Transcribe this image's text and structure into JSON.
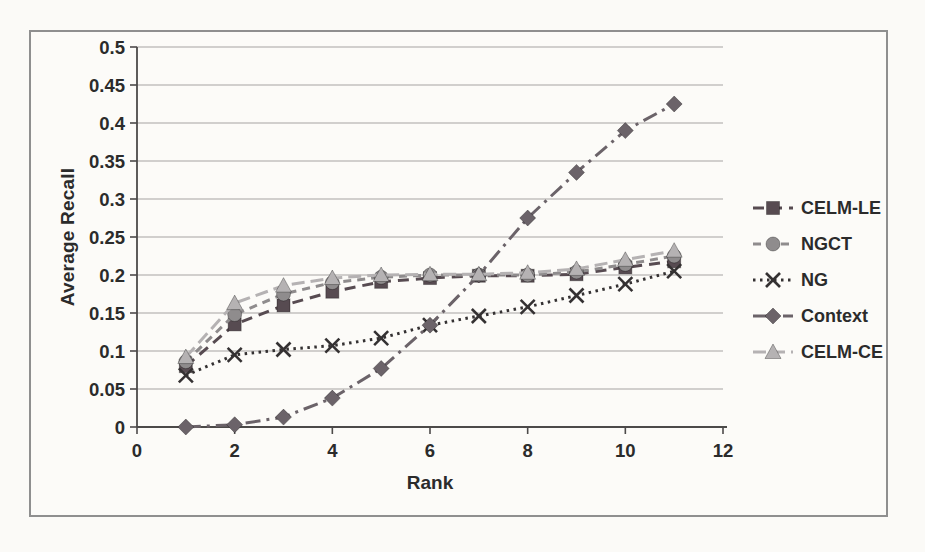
{
  "figure": {
    "background": "#fbfaf7",
    "frame_border_color": "#8f8f8f",
    "text_color": "#2b2b2b",
    "grid_color": "#a6a4a1",
    "axis_color": "#4c4a49"
  },
  "chart_data": {
    "type": "line",
    "title": "",
    "xlabel": "Rank",
    "ylabel": "Average Recall",
    "xlim": [
      0,
      12
    ],
    "ylim": [
      0,
      0.5
    ],
    "grid": "horizontal",
    "legend_position": "right-outside",
    "x_tick_values": [
      0,
      2,
      4,
      6,
      8,
      10,
      12
    ],
    "x_tick_labels": [
      "0",
      "2",
      "4",
      "6",
      "8",
      "10",
      "12"
    ],
    "y_tick_values": [
      0,
      0.05,
      0.1,
      0.15,
      0.2,
      0.25,
      0.3,
      0.35,
      0.4,
      0.45,
      0.5
    ],
    "y_tick_labels": [
      "0",
      "0.05",
      "0.1",
      "0.15",
      "0.2",
      "0.25",
      "0.3",
      "0.35",
      "0.4",
      "0.45",
      "0.5"
    ],
    "x": [
      1,
      2,
      3,
      4,
      5,
      6,
      7,
      8,
      9,
      10,
      11
    ],
    "series": [
      {
        "name": "CELM-LE",
        "marker": "square",
        "color": "#574b51",
        "dash": "11 7",
        "values": [
          0.08,
          0.135,
          0.16,
          0.178,
          0.191,
          0.196,
          0.199,
          0.199,
          0.201,
          0.21,
          0.218
        ]
      },
      {
        "name": "NGCT",
        "marker": "circle",
        "color": "#8f8c8d",
        "dash": "8 6",
        "values": [
          0.086,
          0.148,
          0.175,
          0.19,
          0.197,
          0.2,
          0.2,
          0.2,
          0.204,
          0.214,
          0.225
        ]
      },
      {
        "name": "NG",
        "marker": "x",
        "color": "#343132",
        "dash": "2.5 4.5",
        "values": [
          0.068,
          0.095,
          0.102,
          0.107,
          0.117,
          0.134,
          0.146,
          0.158,
          0.173,
          0.188,
          0.205
        ]
      },
      {
        "name": "Context",
        "marker": "diamond",
        "color": "#6b6369",
        "dash": "15 6 3 6",
        "values": [
          0.0,
          0.003,
          0.013,
          0.038,
          0.077,
          0.134,
          0.2,
          0.275,
          0.335,
          0.39,
          0.425
        ]
      },
      {
        "name": "CELM-CE",
        "marker": "triangle",
        "color": "#b5b2b3",
        "dash": "13 6",
        "values": [
          0.092,
          0.163,
          0.186,
          0.196,
          0.2,
          0.201,
          0.201,
          0.203,
          0.208,
          0.22,
          0.232
        ]
      }
    ]
  }
}
